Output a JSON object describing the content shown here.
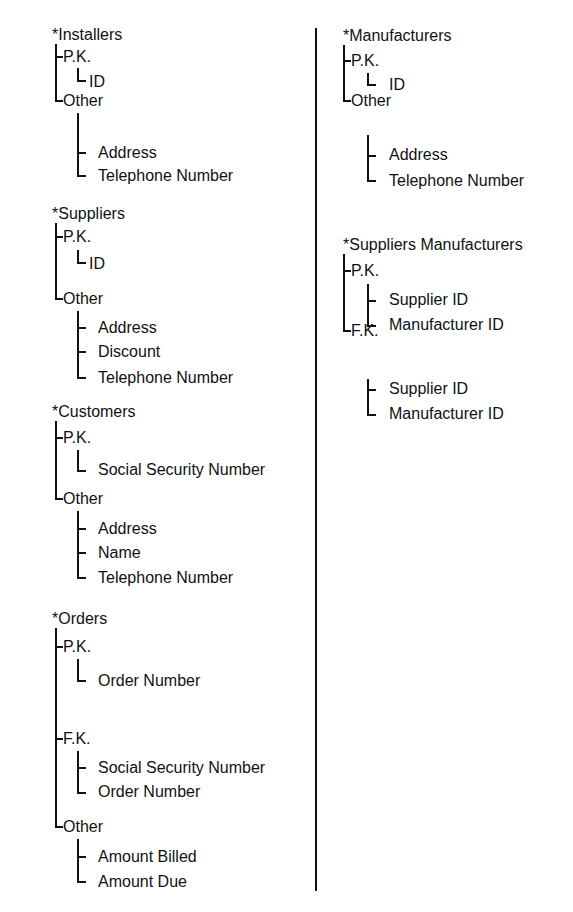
{
  "tables": [
    {
      "name": "*Installers",
      "groups": [
        {
          "label": "P.K.",
          "fields": [
            "ID"
          ]
        },
        {
          "label": "Other",
          "fields": [
            "Address",
            "Telephone Number"
          ]
        }
      ]
    },
    {
      "name": "*Suppliers",
      "groups": [
        {
          "label": "P.K.",
          "fields": [
            "ID"
          ]
        },
        {
          "label": "Other",
          "fields": [
            "Address",
            "Discount",
            "Telephone Number"
          ]
        }
      ]
    },
    {
      "name": "*Customers",
      "groups": [
        {
          "label": "P.K.",
          "fields": [
            "Social Security Number"
          ]
        },
        {
          "label": "Other",
          "fields": [
            "Address",
            "Name",
            "Telephone Number"
          ]
        }
      ]
    },
    {
      "name": "*Orders",
      "groups": [
        {
          "label": "P.K.",
          "fields": [
            "Order Number"
          ]
        },
        {
          "label": "F.K.",
          "fields": [
            "Social Security Number",
            "Order Number"
          ]
        },
        {
          "label": "Other",
          "fields": [
            "Amount Billed",
            "Amount Due"
          ]
        }
      ]
    },
    {
      "name": "*Manufacturers",
      "groups": [
        {
          "label": "P.K.",
          "fields": [
            "ID"
          ]
        },
        {
          "label": "Other",
          "fields": [
            "Address",
            "Telephone Number"
          ]
        }
      ]
    },
    {
      "name": "*Suppliers Manufacturers",
      "groups": [
        {
          "label": "P.K.",
          "fields": [
            "Supplier ID",
            "Manufacturer ID"
          ]
        },
        {
          "label": "F.K.",
          "fields": [
            "Supplier ID",
            "Manufacturer ID"
          ]
        }
      ]
    }
  ]
}
